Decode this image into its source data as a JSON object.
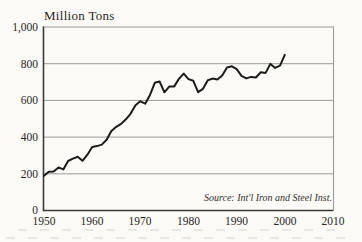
{
  "figure": {
    "title": "Million Tons",
    "source_note": "Source: Int'l Iron and Steel Inst.",
    "y_axis": {
      "labels": [
        "1,000",
        "800",
        "600",
        "400",
        "200",
        "0"
      ]
    },
    "x_axis": {
      "labels": [
        "1950",
        "1960",
        "1970",
        "1980",
        "1990",
        "2000",
        "2010"
      ]
    }
  },
  "colors": {
    "background": "#fbfaf7",
    "line": "#1c1c1c",
    "grid": "#9b9b98",
    "axis": "#3e3a36",
    "text": "#2a2622"
  },
  "chart_data": {
    "type": "line",
    "title": "Million Tons",
    "ylabel": "Million Tons",
    "xlabel": "",
    "x": [
      1950,
      1951,
      1952,
      1953,
      1954,
      1955,
      1956,
      1957,
      1958,
      1959,
      1960,
      1961,
      1962,
      1963,
      1964,
      1965,
      1966,
      1967,
      1968,
      1969,
      1970,
      1971,
      1972,
      1973,
      1974,
      1975,
      1976,
      1977,
      1978,
      1979,
      1980,
      1981,
      1982,
      1983,
      1984,
      1985,
      1986,
      1987,
      1988,
      1989,
      1990,
      1991,
      1992,
      1993,
      1994,
      1995,
      1996,
      1997,
      1998,
      1999,
      2000
    ],
    "values": [
      189,
      211,
      212,
      235,
      224,
      270,
      283,
      293,
      271,
      304,
      346,
      351,
      359,
      386,
      434,
      456,
      472,
      497,
      528,
      574,
      595,
      582,
      630,
      696,
      703,
      644,
      675,
      675,
      717,
      746,
      716,
      707,
      645,
      663,
      710,
      719,
      714,
      736,
      780,
      786,
      770,
      734,
      720,
      728,
      725,
      753,
      750,
      799,
      777,
      789,
      848
    ],
    "xlim": [
      1950,
      2010
    ],
    "ylim": [
      0,
      1000
    ],
    "xticks": [
      1950,
      1960,
      1970,
      1980,
      1990,
      2000,
      2010
    ],
    "yticks": [
      0,
      200,
      400,
      600,
      800,
      1000
    ],
    "grid": true,
    "legend": false,
    "annotations": [
      "Source: Int'l Iron and Steel Inst."
    ]
  }
}
